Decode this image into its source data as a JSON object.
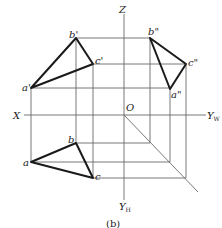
{
  "diagram": {
    "caption": "(b)",
    "axes": {
      "x_label": "X",
      "z_label": "Z",
      "origin_label": "O",
      "yw_label": "Y",
      "yw_sub": "W",
      "yh_label": "Y",
      "yh_sub": "H"
    },
    "front_view": {
      "points": {
        "a": "a'",
        "b": "b'",
        "c": "c'"
      }
    },
    "side_view": {
      "points": {
        "a": "a\"",
        "b": "b\"",
        "c": "c\""
      }
    },
    "top_view": {
      "points": {
        "a": "a",
        "b": "b",
        "c": "c"
      }
    },
    "colors": {
      "thin_line": "#6a6a6a",
      "thick_line": "#1a1a1a",
      "text": "#222222"
    }
  }
}
